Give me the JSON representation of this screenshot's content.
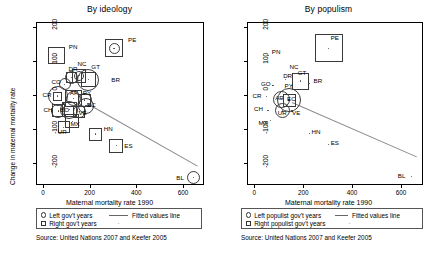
{
  "figure": {
    "width": 438,
    "height": 258,
    "background": "#ffffff"
  },
  "chart_data": [
    {
      "type": "scatter",
      "panel_id": "by-ideology",
      "title": "By ideology",
      "xlabel": "Maternal mortality rate 1990",
      "ylabel": "Change in maternal mortality rate",
      "xlim": [
        -30,
        690
      ],
      "ylim": [
        -265,
        215
      ],
      "xticks": [
        0,
        200,
        400,
        600
      ],
      "yticks": [
        200,
        100,
        0,
        -100,
        -200
      ],
      "grid": false,
      "legend": {
        "position": "below-axis",
        "entries": [
          {
            "marker": "circle",
            "label": "Left gov't years"
          },
          {
            "marker": "square",
            "label": "Right gov't years"
          },
          {
            "marker": "line",
            "label": "Fitted values line"
          },
          {
            "marker": "dot",
            "label": ""
          }
        ]
      },
      "fit_line": {
        "x0": 185,
        "y0": -20,
        "x1": 660,
        "y1": -205
      },
      "points": [
        {
          "code": "PN",
          "x": 55,
          "y": 120,
          "circle": 0,
          "square": 17,
          "label_dx": 12,
          "label_dy": -9
        },
        {
          "code": "PE",
          "x": 300,
          "y": 140,
          "circle": 11,
          "square": 18,
          "label_dx": 14,
          "label_dy": -9
        },
        {
          "code": "NC",
          "x": 152,
          "y": 60,
          "circle": 10,
          "square": 14,
          "label_dx": -2,
          "label_dy": -13
        },
        {
          "code": "GT",
          "x": 190,
          "y": 48,
          "circle": 22,
          "square": 15,
          "label_dx": 3,
          "label_dy": -14
        },
        {
          "code": "BR",
          "x": 220,
          "y": 45,
          "circle": 0,
          "square": 0,
          "label_dx": 16,
          "label_dy": -2
        },
        {
          "code": "DR",
          "x": 118,
          "y": 55,
          "circle": 13,
          "square": 11,
          "label_dx": -3,
          "label_dy": -9
        },
        {
          "code": "CO",
          "x": 88,
          "y": 35,
          "circle": 12,
          "square": 0,
          "label_dx": -13,
          "label_dy": -3
        },
        {
          "code": "CR",
          "x": 58,
          "y": 0,
          "circle": 20,
          "square": 9,
          "label_dx": -15,
          "label_dy": -2
        },
        {
          "code": "AR",
          "x": 128,
          "y": -8,
          "circle": 15,
          "square": 17,
          "label_dx": -4,
          "label_dy": -7
        },
        {
          "code": "PY",
          "x": 175,
          "y": -12,
          "circle": 14,
          "square": 13,
          "label_dx": -2,
          "label_dy": -8
        },
        {
          "code": "EC",
          "x": 180,
          "y": -28,
          "circle": 16,
          "square": 0,
          "label_dx": 1,
          "label_dy": -2
        },
        {
          "code": "CH",
          "x": 62,
          "y": -44,
          "circle": 14,
          "square": 13,
          "label_dx": -15,
          "label_dy": -2
        },
        {
          "code": "BO",
          "x": 108,
          "y": -40,
          "circle": 18,
          "square": 15,
          "label_dx": -9,
          "label_dy": -1
        },
        {
          "code": "VE",
          "x": 152,
          "y": -46,
          "circle": 13,
          "square": 12,
          "label_dx": -1,
          "label_dy": 0
        },
        {
          "code": "MX",
          "x": 122,
          "y": -74,
          "circle": 0,
          "square": 14,
          "label_dx": -2,
          "label_dy": 2
        },
        {
          "code": "UR",
          "x": 85,
          "y": -92,
          "circle": 0,
          "square": 12,
          "label_dx": -6,
          "label_dy": 4
        },
        {
          "code": "HN",
          "x": 222,
          "y": -112,
          "circle": 0,
          "square": 13,
          "label_dx": 8,
          "label_dy": -6
        },
        {
          "code": "ES",
          "x": 310,
          "y": -146,
          "circle": 0,
          "square": 14,
          "label_dx": 8,
          "label_dy": -1
        },
        {
          "code": "BL",
          "x": 640,
          "y": -240,
          "circle": 13,
          "square": 0,
          "label_dx": -17,
          "label_dy": -1
        }
      ]
    },
    {
      "type": "scatter",
      "panel_id": "by-populism",
      "title": "By populism",
      "xlabel": "Maternal mortality rate 1990",
      "ylabel": "",
      "xlim": [
        -30,
        690
      ],
      "ylim": [
        -265,
        215
      ],
      "xticks": [
        0,
        200,
        400,
        600
      ],
      "yticks": [
        200,
        100,
        0,
        -100,
        -200
      ],
      "grid": false,
      "legend": {
        "position": "below-axis",
        "entries": [
          {
            "marker": "circle",
            "label": "Left populist gov't years"
          },
          {
            "marker": "square",
            "label": "Right populist gov't years"
          },
          {
            "marker": "line",
            "label": "Fitted values line"
          },
          {
            "marker": "dot",
            "label": ""
          }
        ]
      },
      "fit_line": {
        "x0": 150,
        "y0": -18,
        "x1": 660,
        "y1": -178
      },
      "points": [
        {
          "code": "PN",
          "x": 55,
          "y": 120,
          "circle": 0,
          "square": 0,
          "label_dx": 3,
          "label_dy": -4
        },
        {
          "code": "PE",
          "x": 300,
          "y": 140,
          "circle": 0,
          "square": 28,
          "label_dx": 2,
          "label_dy": -11
        },
        {
          "code": "NC",
          "x": 152,
          "y": 62,
          "circle": 0,
          "square": 0,
          "label_dx": -3,
          "label_dy": -9
        },
        {
          "code": "GT",
          "x": 186,
          "y": 44,
          "circle": 0,
          "square": 17,
          "label_dx": -3,
          "label_dy": -9
        },
        {
          "code": "BR",
          "x": 222,
          "y": 38,
          "circle": 0,
          "square": 0,
          "label_dx": 4,
          "label_dy": -3
        },
        {
          "code": "DR",
          "x": 122,
          "y": 48,
          "circle": 0,
          "square": 0,
          "label_dx": -2,
          "label_dy": -5
        },
        {
          "code": "GO",
          "x": 72,
          "y": 30,
          "circle": 0,
          "square": 0,
          "label_dx": -12,
          "label_dy": -3
        },
        {
          "code": "PY",
          "x": 148,
          "y": 30,
          "circle": 0,
          "square": 0,
          "label_dx": -7,
          "label_dy": -1
        },
        {
          "code": "CR",
          "x": 46,
          "y": -2,
          "circle": 0,
          "square": 0,
          "label_dx": -14,
          "label_dy": -2
        },
        {
          "code": "AR",
          "x": 106,
          "y": -10,
          "circle": 17,
          "square": 0,
          "label_dx": -6,
          "label_dy": -2
        },
        {
          "code": "EC",
          "x": 138,
          "y": -12,
          "circle": 24,
          "square": 13,
          "label_dx": -2,
          "label_dy": -2
        },
        {
          "code": "CH",
          "x": 52,
          "y": -42,
          "circle": 0,
          "square": 0,
          "label_dx": -14,
          "label_dy": -2
        },
        {
          "code": "UR",
          "x": 112,
          "y": -44,
          "circle": 15,
          "square": 0,
          "label_dx": -5,
          "label_dy": 1
        },
        {
          "code": "VE",
          "x": 150,
          "y": -44,
          "circle": 0,
          "square": 0,
          "label_dx": 0,
          "label_dy": 1
        },
        {
          "code": "MX",
          "x": 62,
          "y": -72,
          "circle": 0,
          "square": 0,
          "label_dx": -12,
          "label_dy": 2
        },
        {
          "code": "HN",
          "x": 222,
          "y": -110,
          "circle": 0,
          "square": 0,
          "label_dx": 2,
          "label_dy": -2
        },
        {
          "code": "ES",
          "x": 300,
          "y": -142,
          "circle": 0,
          "square": 0,
          "label_dx": 2,
          "label_dy": -2
        },
        {
          "code": "BL",
          "x": 640,
          "y": -238,
          "circle": 0,
          "square": 0,
          "label_dx": -14,
          "label_dy": -2
        }
      ]
    }
  ],
  "panels": {
    "left": {
      "title": "By ideology",
      "ylabel": "Change in maternal mortality rate",
      "xlabel": "Maternal mortality rate 1990",
      "legend": {
        "left_label": "Left gov't years",
        "right_label": "Right gov't years",
        "fit_label": "Fitted values line",
        "dot_glyph": "·"
      },
      "source": "Source: United Nations 2007 and Keefer 2005"
    },
    "right": {
      "title": "By populism",
      "ylabel": "",
      "xlabel": "Maternal mortality rate 1990",
      "legend": {
        "left_label": "Left populist gov't years",
        "right_label": "Right populist gov't years",
        "fit_label": "Fitted values line",
        "dot_glyph": "·"
      },
      "source": "Source: United Nations 2007 and Keefer 2005"
    }
  }
}
